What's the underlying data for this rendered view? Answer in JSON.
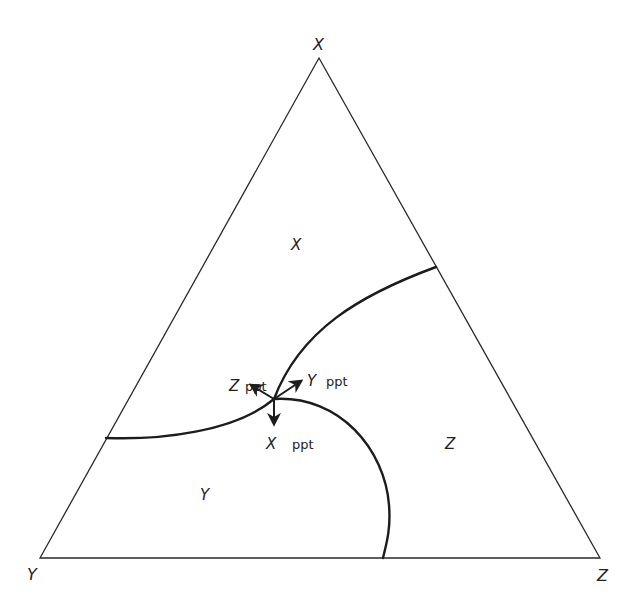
{
  "diagram": {
    "type": "ternary phase diagram",
    "vertices": {
      "top": {
        "label": "X",
        "x": 319,
        "y": 58
      },
      "bottom_left": {
        "label": "Y",
        "x": 40,
        "y": 558
      },
      "bottom_right": {
        "label": "Z",
        "x": 600,
        "y": 558
      }
    },
    "regions": [
      {
        "label": "X",
        "x": 297,
        "y": 250
      },
      {
        "label": "Z",
        "x": 451,
        "y": 449
      },
      {
        "label": "Y",
        "x": 206,
        "y": 500
      }
    ],
    "ternary_point": {
      "x": 274,
      "y": 399
    },
    "boundaries": [
      {
        "name": "X-Y boundary",
        "from": [
          106,
          438
        ],
        "to": [
          274,
          399
        ]
      },
      {
        "name": "X-Z boundary",
        "from": [
          274,
          399
        ],
        "to": [
          436,
          267
        ]
      },
      {
        "name": "Y-Z boundary",
        "from": [
          274,
          399
        ],
        "to": [
          383,
          558
        ]
      }
    ],
    "arrows": [
      {
        "component": "Z",
        "word": "ppt",
        "tip": [
          251,
          385
        ]
      },
      {
        "component": "Y",
        "word": "ppt",
        "tip": [
          301,
          381
        ]
      },
      {
        "component": "X",
        "word": "ppt",
        "tip": [
          274,
          424
        ]
      }
    ]
  }
}
